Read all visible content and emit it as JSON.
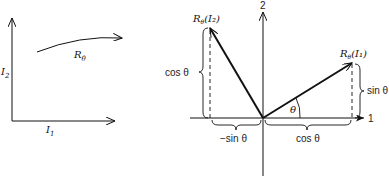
{
  "left_diagram": {
    "x_axis_label": "I",
    "x_axis_sub": "1",
    "y_axis_label": "I",
    "y_axis_sub": "2",
    "transform_label": "R",
    "transform_sub": "θ"
  },
  "right_diagram": {
    "axis_1_label": "1",
    "axis_2_label": "2",
    "vector_1_label": "R",
    "vector_1_sub": "θ",
    "vector_1_arg": "(I₁)",
    "vector_2_label": "R",
    "vector_2_sub": "θ",
    "vector_2_arg": "(I₂)",
    "angle_label": "θ",
    "sin_right_label": "sin θ",
    "cos_left_label": "cos θ",
    "neg_sin_label": "−sin θ",
    "cos_bottom_label": "cos θ"
  },
  "colors": {
    "ink": "#111111",
    "background": "#ffffff"
  }
}
